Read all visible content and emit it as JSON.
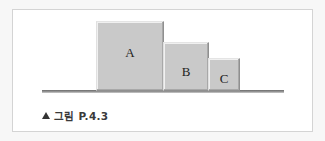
{
  "figure": {
    "blocks": [
      {
        "id": "A",
        "label": "A"
      },
      {
        "id": "B",
        "label": "B"
      },
      {
        "id": "C",
        "label": "C"
      }
    ],
    "caption": {
      "marker_icon": "triangle-up-icon",
      "text": "그림 P.4.3"
    },
    "colors": {
      "block_fill": "#c9c9c9",
      "ground": "#7a7a7a",
      "frame_border": "#d4d4d4"
    }
  }
}
